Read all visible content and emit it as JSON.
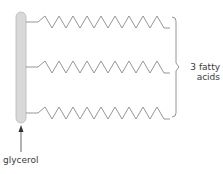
{
  "diagram": {
    "labels": {
      "glycerol": "glycerol",
      "fatty_acids_line1": "3 fatty",
      "fatty_acids_line2": "acids"
    },
    "colors": {
      "glycerol_fill": "#d9d9d9",
      "glycerol_stroke": "#b8b8b8",
      "chain_stroke": "#8a8a8a",
      "text": "#3a3a3a"
    },
    "fatty_acid_chains": [
      {
        "id": "chain-1",
        "y_center": 22
      },
      {
        "id": "chain-2",
        "y_center": 67
      },
      {
        "id": "chain-3",
        "y_center": 113
      }
    ]
  }
}
